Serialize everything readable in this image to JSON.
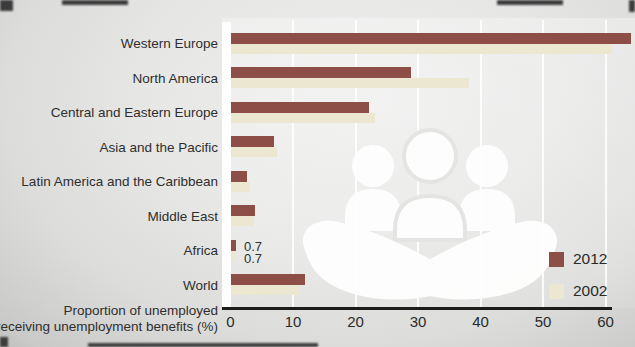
{
  "chart_data": {
    "type": "bar",
    "orientation": "horizontal",
    "title": "",
    "xlabel_line1": "Proportion of unemployed",
    "xlabel_line2": "receiving unemployment benefits (%)",
    "categories": [
      "Western Europe",
      "North America",
      "Central and Eastern Europe",
      "Asia and the Pacific",
      "Latin America and the Caribbean",
      "Middle East",
      "Africa",
      "World"
    ],
    "series": [
      {
        "name": "2012",
        "color": "#8d4e48",
        "values": [
          64,
          28.8,
          22,
          6.9,
          2.6,
          3.8,
          0.7,
          11.8
        ]
      },
      {
        "name": "2002",
        "color": "#ece7d0",
        "values": [
          61,
          38,
          23,
          7.3,
          3.0,
          3.6,
          0.7,
          11.0
        ]
      }
    ],
    "x_ticks": [
      "0",
      "10",
      "20",
      "30",
      "40",
      "50",
      "60"
    ],
    "xlim": [
      0,
      64
    ],
    "annotations": [
      {
        "category": "Africa",
        "series": "2012",
        "text": "0.7"
      },
      {
        "category": "Africa",
        "series": "2002",
        "text": "0.7"
      }
    ],
    "legend": [
      {
        "label": "2012",
        "color": "#8d4e48"
      },
      {
        "label": "2002",
        "color": "#ece7d0"
      }
    ],
    "legend_position": "bottom-right",
    "gridlines": "vertical white lines at each x tick",
    "watermark": "white silhouette of three people above two cupped hands"
  }
}
